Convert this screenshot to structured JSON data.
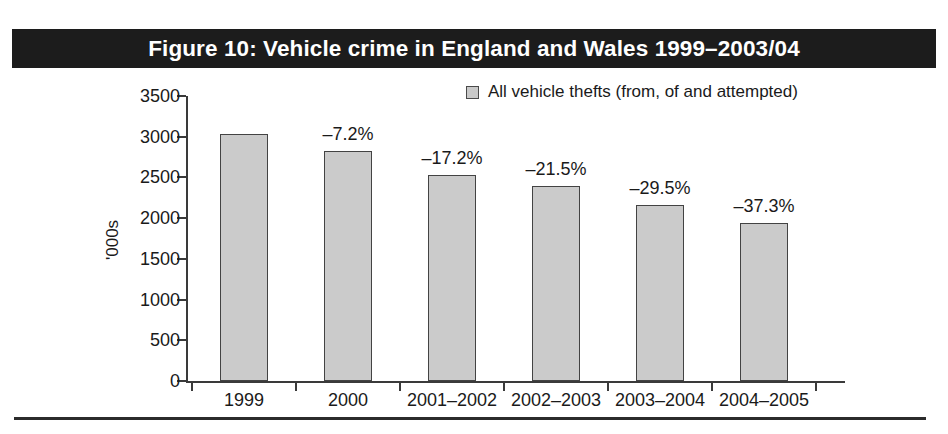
{
  "figure": {
    "title": "Figure 10: Vehicle crime in England and Wales 1999–2003/04",
    "title_bar_color": "#1c1c1c",
    "title_text_color": "#ffffff",
    "bottom_rule_color": "#2b2b2b"
  },
  "legend": {
    "position": "top-right",
    "swatch_icon": "square-swatch-icon",
    "swatch_fill": "#c9c9c9",
    "swatch_border": "#4a4a4a",
    "entries": [
      {
        "label": "All vehicle thefts (from, of and attempted)"
      }
    ]
  },
  "chart_data": {
    "type": "bar",
    "title": "Figure 10: Vehicle crime in England and Wales 1999–2003/04",
    "xlabel": "",
    "ylabel": "'000s",
    "categories": [
      "1999",
      "2000",
      "2001–2002",
      "2002–2003",
      "2003–2004",
      "2004–2005"
    ],
    "series": [
      {
        "name": "All vehicle thefts (from, of and attempted)",
        "values": [
          3030,
          2820,
          2530,
          2400,
          2160,
          1940
        ]
      }
    ],
    "annotations": [
      "",
      "–7.2%",
      "–17.2%",
      "–21.5%",
      "–29.5%",
      "–37.3%"
    ],
    "ylim": [
      0,
      3500
    ],
    "yticks": [
      0,
      500,
      1000,
      1500,
      2000,
      2500,
      3000,
      3500
    ],
    "ytick_labels": [
      "0",
      "500",
      "1000",
      "1500",
      "2000",
      "2500",
      "3000",
      "3500"
    ],
    "grid": false,
    "legend_position": "top-right",
    "bar_fill": "#cbcbcb",
    "bar_border": "#434343"
  }
}
